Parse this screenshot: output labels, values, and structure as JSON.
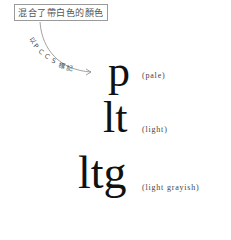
{
  "caption": {
    "text": "混合了帶白色的顏色"
  },
  "arrow": {
    "label": "以PCCS標記",
    "chars": [
      "以",
      "P",
      "C",
      "C",
      "S",
      "標",
      "記"
    ],
    "color": "#888888"
  },
  "tones": [
    {
      "abbr": "p",
      "name": "(pale)"
    },
    {
      "abbr": "lt",
      "name": "(light)"
    },
    {
      "abbr": "ltg",
      "name": "(light grayish)"
    }
  ]
}
